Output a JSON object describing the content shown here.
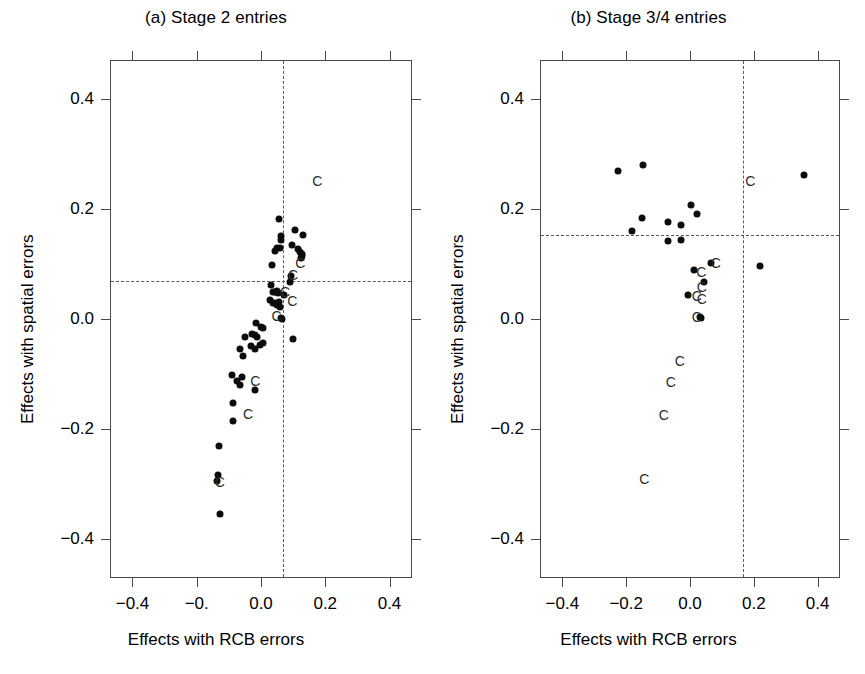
{
  "figure": {
    "type": "scatter-panel-figure",
    "panels": [
      "a",
      "b"
    ]
  },
  "panel_a": {
    "title": "(a) Stage 2 entries",
    "xlabel": "Effects with RCB errors",
    "ylabel": "Effects with spatial errors"
  },
  "panel_b": {
    "title": "(b) Stage 3/4 entries",
    "xlabel": "Effects with RCB errors",
    "ylabel": "Effects with spatial errors"
  },
  "chart_data": [
    {
      "type": "scatter",
      "panel": "a",
      "title": "(a) Stage 2 entries",
      "xlabel": "Effects with RCB errors",
      "ylabel": "Effects with spatial errors",
      "xlim": [
        -0.47,
        0.47
      ],
      "ylim": [
        -0.47,
        0.47
      ],
      "xticks": [
        -0.4,
        -0.2,
        0.0,
        0.2,
        0.4
      ],
      "xticklabels": [
        "-0.4",
        "-0.",
        "0.0",
        "0.2",
        "0.4"
      ],
      "yticks": [
        -0.4,
        -0.2,
        0.0,
        0.2,
        0.4
      ],
      "yticklabels": [
        "-0.4",
        "-0.2",
        "0.0",
        "0.2",
        "0.4"
      ],
      "grid": false,
      "legend": null,
      "reference_lines": {
        "vertical_x": 0.065,
        "horizontal_y": 0.07,
        "style": "dashed"
      },
      "series": [
        {
          "name": "points",
          "marker": "filled-circle",
          "color": "#0c0c0c",
          "points": [
            [
              0.052,
              0.184
            ],
            [
              0.058,
              0.152
            ],
            [
              0.06,
              0.145
            ],
            [
              0.047,
              0.131
            ],
            [
              0.057,
              0.13
            ],
            [
              0.039,
              0.125
            ],
            [
              0.03,
              0.1
            ],
            [
              0.104,
              0.163
            ],
            [
              0.128,
              0.155
            ],
            [
              0.094,
              0.137
            ],
            [
              0.113,
              0.129
            ],
            [
              0.119,
              0.124
            ],
            [
              0.123,
              0.12
            ],
            [
              0.126,
              0.116
            ],
            [
              0.122,
              0.112
            ],
            [
              0.09,
              0.079
            ],
            [
              0.086,
              0.069
            ],
            [
              0.029,
              0.063
            ],
            [
              0.033,
              0.051
            ],
            [
              0.04,
              0.05
            ],
            [
              0.046,
              0.052
            ],
            [
              0.05,
              0.049
            ],
            [
              0.069,
              0.046
            ],
            [
              0.026,
              0.036
            ],
            [
              0.035,
              0.031
            ],
            [
              0.042,
              0.03
            ],
            [
              0.047,
              0.028
            ],
            [
              0.052,
              0.033
            ],
            [
              0.055,
              0.024
            ],
            [
              0.059,
              0.004
            ],
            [
              0.063,
              0.002
            ],
            [
              -0.018,
              -0.006
            ],
            [
              -0.004,
              -0.012
            ],
            [
              0.004,
              -0.014
            ],
            [
              0.096,
              -0.034
            ],
            [
              -0.053,
              -0.03
            ],
            [
              -0.032,
              -0.026
            ],
            [
              -0.022,
              -0.027
            ],
            [
              -0.017,
              -0.03
            ],
            [
              -0.035,
              -0.047
            ],
            [
              0.002,
              -0.041
            ],
            [
              -0.007,
              -0.046
            ],
            [
              -0.07,
              -0.052
            ],
            [
              -0.058,
              -0.065
            ],
            [
              -0.021,
              -0.053
            ],
            [
              -0.092,
              -0.099
            ],
            [
              -0.079,
              -0.11
            ],
            [
              -0.063,
              -0.103
            ],
            [
              -0.069,
              -0.118
            ],
            [
              -0.09,
              -0.151
            ],
            [
              -0.09,
              -0.184
            ],
            [
              -0.022,
              -0.127
            ],
            [
              -0.133,
              -0.229
            ],
            [
              -0.137,
              -0.281
            ],
            [
              -0.14,
              -0.292
            ],
            [
              -0.131,
              -0.352
            ]
          ]
        },
        {
          "name": "check-entries",
          "marker": "letter-C",
          "label": "C",
          "color": "#2b2b2b",
          "points": [
            [
              0.172,
              0.252
            ],
            [
              0.119,
              0.103
            ],
            [
              0.097,
              0.081
            ],
            [
              0.072,
              0.051
            ],
            [
              0.094,
              0.034
            ],
            [
              0.045,
              0.007
            ],
            [
              -0.021,
              -0.11
            ],
            [
              -0.043,
              -0.171
            ],
            [
              -0.131,
              -0.294
            ]
          ]
        }
      ]
    },
    {
      "type": "scatter",
      "panel": "b",
      "title": "(b) Stage 3/4 entries",
      "xlabel": "Effects with RCB errors",
      "ylabel": "Effects with spatial errors",
      "xlim": [
        -0.47,
        0.47
      ],
      "ylim": [
        -0.47,
        0.47
      ],
      "xticks": [
        -0.4,
        -0.2,
        0.0,
        0.2,
        0.4
      ],
      "xticklabels": [
        "-0.4",
        "-0.2",
        "0.0",
        "0.2",
        "0.4"
      ],
      "yticks": [
        -0.4,
        -0.2,
        0.0,
        0.2,
        0.4
      ],
      "yticklabels": [
        "-0.4",
        "-0.2",
        "0.0",
        "0.2",
        "0.4"
      ],
      "grid": false,
      "legend": null,
      "reference_lines": {
        "vertical_x": 0.162,
        "horizontal_y": 0.155,
        "style": "dashed"
      },
      "series": [
        {
          "name": "points",
          "marker": "filled-circle",
          "color": "#0c0c0c",
          "points": [
            [
              -0.228,
              0.27
            ],
            [
              -0.15,
              0.281
            ],
            [
              0.355,
              0.264
            ],
            [
              -0.185,
              0.161
            ],
            [
              -0.152,
              0.186
            ],
            [
              -0.072,
              0.178
            ],
            [
              -0.072,
              0.143
            ],
            [
              -0.031,
              0.172
            ],
            [
              -0.031,
              0.146
            ],
            [
              0.0,
              0.208
            ],
            [
              0.018,
              0.193
            ],
            [
              0.063,
              0.103
            ],
            [
              0.216,
              0.098
            ],
            [
              0.01,
              0.091
            ],
            [
              0.042,
              0.069
            ],
            [
              -0.01,
              0.045
            ],
            [
              0.027,
              0.006
            ],
            [
              0.03,
              0.004
            ]
          ]
        },
        {
          "name": "check-entries",
          "marker": "letter-C",
          "label": "C",
          "color": "#2b2b2b",
          "points": [
            [
              0.186,
              0.253
            ],
            [
              0.078,
              0.104
            ],
            [
              0.032,
              0.088
            ],
            [
              0.034,
              0.06
            ],
            [
              0.018,
              0.043
            ],
            [
              0.034,
              0.039
            ],
            [
              0.018,
              0.006
            ],
            [
              -0.035,
              -0.075
            ],
            [
              -0.063,
              -0.113
            ],
            [
              -0.085,
              -0.173
            ],
            [
              -0.146,
              -0.288
            ]
          ]
        }
      ]
    }
  ]
}
